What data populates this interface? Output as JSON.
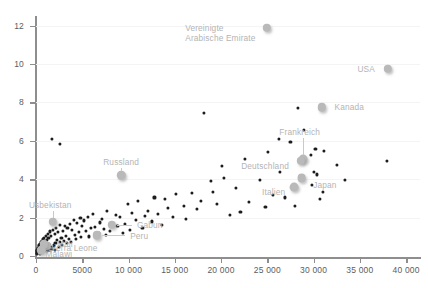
{
  "chart_data": {
    "type": "scatter",
    "title": "",
    "xlabel": "",
    "ylabel": "",
    "xlim": [
      0,
      41500
    ],
    "ylim": [
      0,
      12.4
    ],
    "grid": true,
    "legend": "none",
    "xticks": [
      {
        "value": 0,
        "label": "0"
      },
      {
        "value": 5000,
        "label": "5000"
      },
      {
        "value": 10000,
        "label": "10 000"
      },
      {
        "value": 15000,
        "label": "15 000"
      },
      {
        "value": 20000,
        "label": "20 000"
      },
      {
        "value": 25000,
        "label": "25 000"
      },
      {
        "value": 30000,
        "label": "30 000"
      },
      {
        "value": 35000,
        "label": "35 000"
      },
      {
        "value": 40000,
        "label": "40 000"
      }
    ],
    "yticks": [
      {
        "value": 0,
        "label": "0"
      },
      {
        "value": 2,
        "label": "2"
      },
      {
        "value": 4,
        "label": "4"
      },
      {
        "value": 6,
        "label": "6"
      },
      {
        "value": 8,
        "label": "8"
      },
      {
        "value": 10,
        "label": "10"
      },
      {
        "value": 12,
        "label": "12"
      }
    ],
    "point_color": "#1c1c1c",
    "highlight_color": "#b9b9b9",
    "label_color": "#b4b4b4",
    "axis_color": "#8e8e8e",
    "grid_color": "#f4f4f4",
    "annotations": [
      {
        "label": "Vereinigte\nArabische Emirate",
        "x": 24700,
        "y": 11.85,
        "align": "right",
        "dx": -9,
        "dy": 4
      },
      {
        "label": "USA",
        "x": 37600,
        "y": 9.75,
        "align": "right",
        "dx": -9,
        "dy": 0
      },
      {
        "label": "Kanada",
        "x": 31300,
        "y": 7.75,
        "align": "left",
        "dx": 9,
        "dy": 0
      },
      {
        "label": "Frankreich",
        "x": 28500,
        "y": 5.95,
        "align": "center",
        "dx": 0,
        "dy": -10
      },
      {
        "label": "Deutschland",
        "x": 28200,
        "y": 4.7,
        "align": "right",
        "dx": -8,
        "dy": 0
      },
      {
        "label": "Japan",
        "x": 29100,
        "y": 3.85,
        "align": "left",
        "dx": 8,
        "dy": 3
      },
      {
        "label": "Italien",
        "x": 27700,
        "y": 3.7,
        "align": "right",
        "dx": -7,
        "dy": 7
      },
      {
        "label": "Russland",
        "x": 9200,
        "y": 4.35,
        "align": "center",
        "dx": 0,
        "dy": -11
      },
      {
        "label": "Usbekistan",
        "x": 1750,
        "y": 2.1,
        "align": "center",
        "dx": -2,
        "dy": -11
      },
      {
        "label": "Gabun",
        "x": 8100,
        "y": 1.6,
        "align": "left",
        "dx": 26,
        "dy": 0
      },
      {
        "label": "Peru",
        "x": 6500,
        "y": 1.05,
        "align": "left",
        "dx": 34,
        "dy": 0
      },
      {
        "label": "Mali",
        "x": 1500,
        "y": 0.62,
        "align": "left",
        "dx": 7,
        "dy": 0
      },
      {
        "label": "Sierra Leone",
        "x": 900,
        "y": 0.4,
        "align": "left",
        "dx": 4,
        "dy": 0
      },
      {
        "label": "Malawi",
        "x": 600,
        "y": 0.08,
        "align": "left",
        "dx": 4,
        "dy": 0
      }
    ],
    "highlighted_points": [
      {
        "name": "Vereinigte Arabische Emirate",
        "x": 24950,
        "y": 11.9,
        "r": 4.2
      },
      {
        "name": "USA",
        "x": 38000,
        "y": 9.75,
        "r": 4.2
      },
      {
        "name": "Kanada",
        "x": 30900,
        "y": 7.75,
        "r": 4.2
      },
      {
        "name": "Frankreich",
        "x": 28900,
        "y": 5.05,
        "r": 4.4
      },
      {
        "name": "Deutschland",
        "x": 28600,
        "y": 4.95,
        "r": 4.2
      },
      {
        "name": "Japan",
        "x": 28700,
        "y": 4.05,
        "r": 4.4
      },
      {
        "name": "Italien",
        "x": 27900,
        "y": 3.6,
        "r": 4.4
      },
      {
        "name": "Russland",
        "x": 9200,
        "y": 4.2,
        "r": 4.2
      },
      {
        "name": "Usbekistan",
        "x": 1800,
        "y": 1.78,
        "r": 4.2
      },
      {
        "name": "Gabun",
        "x": 8200,
        "y": 1.62,
        "r": 4.2
      },
      {
        "name": "Peru",
        "x": 6600,
        "y": 1.08,
        "r": 4.2
      },
      {
        "name": "Mali",
        "x": 1100,
        "y": 0.52,
        "r": 4.2
      },
      {
        "name": "Sierra Leone",
        "x": 830,
        "y": 0.6,
        "r": 4.2
      },
      {
        "name": "Malawi",
        "x": 560,
        "y": 0.3,
        "r": 4.2
      }
    ],
    "points": [
      [
        1750,
        6.1
      ],
      [
        2600,
        5.85
      ],
      [
        18200,
        7.45
      ],
      [
        37900,
        4.95
      ],
      [
        28300,
        7.7
      ],
      [
        29000,
        6.55
      ],
      [
        26300,
        6.1
      ],
      [
        27500,
        5.95
      ],
      [
        30200,
        5.6
      ],
      [
        31100,
        5.45
      ],
      [
        25100,
        5.4
      ],
      [
        29700,
        5.25
      ],
      [
        22600,
        5.05
      ],
      [
        20100,
        4.7
      ],
      [
        26400,
        4.4
      ],
      [
        30000,
        4.4
      ],
      [
        30400,
        4.25
      ],
      [
        20300,
        4.05
      ],
      [
        24200,
        3.95
      ],
      [
        18900,
        3.9
      ],
      [
        29800,
        3.7
      ],
      [
        21600,
        3.55
      ],
      [
        19100,
        3.35
      ],
      [
        16900,
        3.3
      ],
      [
        31000,
        3.35
      ],
      [
        15100,
        3.25
      ],
      [
        12800,
        3.05
      ],
      [
        13900,
        2.95
      ],
      [
        11000,
        2.85
      ],
      [
        9900,
        2.7
      ],
      [
        16000,
        2.6
      ],
      [
        17400,
        2.45
      ],
      [
        14300,
        2.5
      ],
      [
        12100,
        2.35
      ],
      [
        10400,
        2.25
      ],
      [
        8600,
        2.15
      ],
      [
        7700,
        2.35
      ],
      [
        9100,
        2.05
      ],
      [
        7100,
        1.95
      ],
      [
        6200,
        2.2
      ],
      [
        5600,
        2.05
      ],
      [
        6900,
        1.75
      ],
      [
        5200,
        1.85
      ],
      [
        4800,
        2.0
      ],
      [
        4400,
        1.7
      ],
      [
        5000,
        1.55
      ],
      [
        4100,
        1.9
      ],
      [
        3700,
        1.65
      ],
      [
        3400,
        1.45
      ],
      [
        3900,
        1.35
      ],
      [
        3100,
        1.55
      ],
      [
        2900,
        1.3
      ],
      [
        2600,
        1.6
      ],
      [
        2400,
        1.25
      ],
      [
        2200,
        1.45
      ],
      [
        2000,
        1.15
      ],
      [
        1850,
        1.38
      ],
      [
        1650,
        1.05
      ],
      [
        1500,
        1.28
      ],
      [
        1350,
        0.95
      ],
      [
        1250,
        1.15
      ],
      [
        1150,
        0.85
      ],
      [
        1050,
        1.05
      ],
      [
        950,
        0.78
      ],
      [
        880,
        0.95
      ],
      [
        800,
        0.7
      ],
      [
        740,
        0.88
      ],
      [
        680,
        0.62
      ],
      [
        620,
        0.8
      ],
      [
        570,
        0.55
      ],
      [
        520,
        0.72
      ],
      [
        470,
        0.48
      ],
      [
        430,
        0.65
      ],
      [
        390,
        0.42
      ],
      [
        350,
        0.58
      ],
      [
        320,
        0.36
      ],
      [
        290,
        0.5
      ],
      [
        260,
        0.3
      ],
      [
        240,
        0.44
      ],
      [
        215,
        0.26
      ],
      [
        195,
        0.38
      ],
      [
        175,
        0.22
      ],
      [
        160,
        0.33
      ],
      [
        145,
        0.18
      ],
      [
        130,
        0.28
      ],
      [
        118,
        0.15
      ],
      [
        105,
        0.24
      ],
      [
        95,
        0.12
      ],
      [
        2750,
        0.95
      ],
      [
        3200,
        1.05
      ],
      [
        2100,
        0.7
      ],
      [
        1900,
        0.55
      ],
      [
        1600,
        0.45
      ],
      [
        1400,
        0.6
      ],
      [
        1200,
        0.5
      ],
      [
        1000,
        0.4
      ],
      [
        2300,
        0.85
      ],
      [
        2550,
        0.72
      ],
      [
        3000,
        0.8
      ],
      [
        3600,
        0.9
      ],
      [
        4200,
        1.1
      ],
      [
        4600,
        1.25
      ],
      [
        5400,
        1.3
      ],
      [
        5900,
        1.45
      ],
      [
        6400,
        1.52
      ],
      [
        7300,
        1.42
      ],
      [
        8000,
        1.3
      ],
      [
        8800,
        1.55
      ],
      [
        9600,
        1.68
      ],
      [
        6800,
        1.22
      ],
      [
        7600,
        1.12
      ],
      [
        5700,
        1.02
      ],
      [
        4900,
        0.98
      ],
      [
        4300,
        0.88
      ],
      [
        3800,
        0.75
      ],
      [
        3300,
        0.68
      ],
      [
        2800,
        0.58
      ],
      [
        2450,
        0.48
      ],
      [
        11800,
        2.1
      ],
      [
        13200,
        2.2
      ],
      [
        10800,
        1.9
      ],
      [
        12500,
        1.8
      ],
      [
        14800,
        2.05
      ],
      [
        16200,
        1.95
      ],
      [
        9400,
        1.2
      ],
      [
        10200,
        1.35
      ],
      [
        11500,
        1.48
      ],
      [
        13600,
        1.6
      ],
      [
        1750,
        0.35
      ],
      [
        2050,
        0.32
      ],
      [
        1450,
        0.3
      ],
      [
        1150,
        0.28
      ],
      [
        890,
        0.25
      ],
      [
        700,
        0.2
      ],
      [
        540,
        0.16
      ],
      [
        420,
        0.13
      ],
      [
        23000,
        2.8
      ],
      [
        24800,
        2.55
      ],
      [
        22100,
        2.3
      ],
      [
        19600,
        2.7
      ],
      [
        17800,
        2.85
      ],
      [
        21000,
        2.15
      ],
      [
        25600,
        3.2
      ],
      [
        26900,
        3.05
      ],
      [
        32500,
        4.75
      ],
      [
        33400,
        3.95
      ],
      [
        30700,
        2.95
      ],
      [
        28000,
        2.6
      ]
    ]
  }
}
